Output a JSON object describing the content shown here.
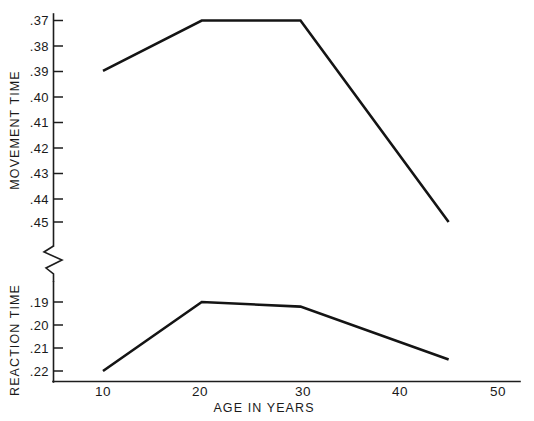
{
  "chart_data": {
    "type": "line",
    "title": "",
    "subtitle": "",
    "xlabel": "AGE IN YEARS",
    "ylabel_top": "MOVEMENT TIME",
    "ylabel_bottom": "REACTION TIME",
    "grid": false,
    "legend": "none",
    "axis_break": true,
    "x": [
      10,
      20,
      30,
      45
    ],
    "xlim": [
      5,
      50
    ],
    "xticks": [
      10,
      20,
      30,
      40,
      50
    ],
    "xtick_labels": [
      "10",
      "20",
      "30",
      "40",
      "50"
    ],
    "panels": [
      {
        "name": "movement-time",
        "ylabel": "MOVEMENT TIME",
        "yticks": [
          0.37,
          0.38,
          0.39,
          0.4,
          0.41,
          0.42,
          0.43,
          0.44,
          0.45
        ],
        "ytick_labels": [
          ".37",
          ".38",
          ".39",
          ".40",
          ".41",
          ".42",
          ".43",
          ".44",
          ".45"
        ],
        "ylim_inverted": true,
        "series": [
          {
            "name": "Movement time",
            "x": [
              10,
              20,
              30,
              45
            ],
            "values": [
              0.39,
              0.37,
              0.37,
              0.45
            ]
          }
        ]
      },
      {
        "name": "reaction-time",
        "ylabel": "REACTION TIME",
        "yticks": [
          0.19,
          0.2,
          0.21,
          0.22
        ],
        "ytick_labels": [
          ".19",
          ".20",
          ".21",
          ".22"
        ],
        "ylim_inverted": true,
        "series": [
          {
            "name": "Reaction time",
            "x": [
              10,
              20,
              30,
              45
            ],
            "values": [
              0.22,
              0.19,
              0.192,
              0.215
            ]
          }
        ]
      }
    ],
    "colors": {
      "line": "#141414",
      "axis": "#1d1d1d",
      "background": "#ffffff"
    }
  },
  "labels": {
    "y_top_axis_title": "MOVEMENT TIME",
    "y_bottom_axis_title": "REACTION TIME",
    "x_axis_title": "AGE IN YEARS",
    "y_top_ticks": [
      ".37",
      ".38",
      ".39",
      ".40",
      ".41",
      ".42",
      ".43",
      ".44",
      ".45"
    ],
    "y_bottom_ticks": [
      ".19",
      ".20",
      ".21",
      ".22"
    ],
    "x_ticks": [
      "10",
      "20",
      "30",
      "40",
      "50"
    ]
  }
}
